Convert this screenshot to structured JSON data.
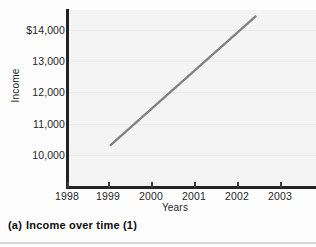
{
  "figure": {
    "caption_index": "(a)",
    "caption_text": "Income over time (1)"
  },
  "colors": {
    "line": "#808080",
    "axis": "#232323",
    "plot_background": "#f4f4f4",
    "gridline": "#ebebeb",
    "text": "#1f1f1f"
  },
  "chart_data": {
    "type": "line",
    "title": "",
    "xlabel": "Years",
    "ylabel": "Income",
    "xlim": [
      1998,
      2003.8
    ],
    "ylim": [
      9400,
      14700
    ],
    "grid": true,
    "legend": "none",
    "xticks": [
      1998,
      1999,
      2000,
      2001,
      2002,
      2003
    ],
    "xtick_labels": [
      "1998",
      "1999",
      "2000",
      "2001",
      "2002",
      "2003"
    ],
    "yticks": [
      10000,
      11000,
      12000,
      13000,
      14000
    ],
    "ytick_labels": [
      "10,000",
      "11,000",
      "12,000",
      "13,000",
      "$14,000"
    ],
    "series": [
      {
        "name": "Income",
        "x": [
          1999,
          2002.4
        ],
        "values": [
          10300,
          14450
        ]
      }
    ]
  }
}
